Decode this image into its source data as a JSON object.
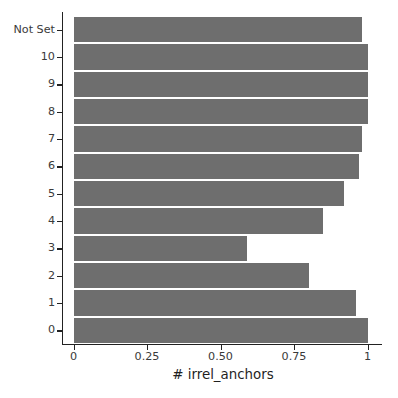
{
  "chart_data": {
    "type": "bar",
    "orientation": "horizontal",
    "title": "",
    "xlabel": "# irrel_anchors",
    "ylabel": "",
    "categories": [
      "Not Set",
      "10",
      "9",
      "8",
      "7",
      "6",
      "5",
      "4",
      "3",
      "2",
      "1",
      "0"
    ],
    "values": [
      0.98,
      1.0,
      1.0,
      1.0,
      0.98,
      0.97,
      0.92,
      0.85,
      0.59,
      0.8,
      0.96,
      1.0
    ],
    "xlim": [
      0,
      1
    ],
    "xticks": [
      0,
      0.25,
      0.5,
      0.75,
      1
    ],
    "xtick_labels": [
      "0",
      "0.25",
      "0.50",
      "0.75",
      "1"
    ],
    "grid": false,
    "legend": null,
    "bar_color": "#6e6e6e",
    "axis_color": "#222222",
    "background": "#ffffff"
  }
}
